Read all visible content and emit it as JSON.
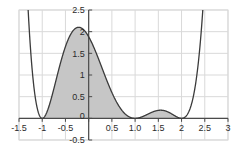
{
  "chart_data": {
    "type": "area",
    "title": "",
    "subtitle": "",
    "xlabel": "",
    "ylabel": "",
    "xlim": [
      -1.5,
      3
    ],
    "ylim": [
      -0.5,
      2.5
    ],
    "grid": true,
    "legend": null,
    "x_ticks": [
      {
        "value": -1.5,
        "label": "-1.5"
      },
      {
        "value": -1,
        "label": "-1"
      },
      {
        "value": -0.5,
        "label": "-0.5"
      },
      {
        "value": 0,
        "label": "0"
      },
      {
        "value": 0.5,
        "label": "0.5"
      },
      {
        "value": 1,
        "label": "1.0"
      },
      {
        "value": 1.5,
        "label": "1.5"
      },
      {
        "value": 2,
        "label": "2"
      },
      {
        "value": 2.5,
        "label": "2.5"
      },
      {
        "value": 3,
        "label": "3"
      }
    ],
    "y_ticks": [
      {
        "value": -0.5,
        "label": "-0.5"
      },
      {
        "value": 0,
        "label": "0"
      },
      {
        "value": 0.5,
        "label": "0.5"
      },
      {
        "value": 1,
        "label": "1"
      },
      {
        "value": 1.5,
        "label": "1.5"
      },
      {
        "value": 2,
        "label": "2"
      },
      {
        "value": 2.5,
        "label": "2.5"
      }
    ],
    "series": [
      {
        "name": "f(x)",
        "color": "#3b3b3b",
        "fill_color": "#c6c6c6",
        "fill_from": -1,
        "fill_to": 2,
        "roots": [
          -1,
          1,
          2
        ],
        "local_maxima": [
          {
            "x": -0.2,
            "y": 2.1
          },
          {
            "x": 1.55,
            "y": 0.63
          }
        ],
        "x": [
          -1.5,
          -1.4,
          -1.3,
          -1.2,
          -1.1,
          -1.0,
          -0.9,
          -0.8,
          -0.7,
          -0.6,
          -0.5,
          -0.4,
          -0.3,
          -0.2,
          -0.1,
          0.0,
          0.1,
          0.2,
          0.3,
          0.4,
          0.5,
          0.6,
          0.7,
          0.8,
          0.9,
          1.0,
          1.1,
          1.2,
          1.3,
          1.4,
          1.5,
          1.6,
          1.7,
          1.8,
          1.9,
          2.0,
          2.1,
          2.2,
          2.3,
          2.4,
          2.5,
          2.6,
          2.7,
          2.8,
          2.9,
          3.0
        ],
        "y": [
          7.66,
          5.76,
          4.2,
          2.96,
          1.98,
          1.26,
          0.75,
          0.41,
          0.2,
          0.09,
          0.03,
          0.01,
          0.0,
          0.0,
          0.0,
          0.0,
          0.0,
          0.0,
          0.0,
          0.0,
          0.0,
          0.0,
          0.0,
          0.0,
          0.0,
          0.0,
          0.0,
          0.0,
          0.0,
          0.0,
          0.0,
          0.0,
          0.0,
          0.0,
          0.0,
          0.0,
          0.0,
          0.0,
          0.0,
          0.0,
          0.0,
          0.0,
          0.0,
          0.0,
          0.0,
          0.0
        ]
      }
    ],
    "axis_color": "#4a4a4a",
    "grid_color": "#d9d9d9",
    "background": "#ffffff"
  }
}
